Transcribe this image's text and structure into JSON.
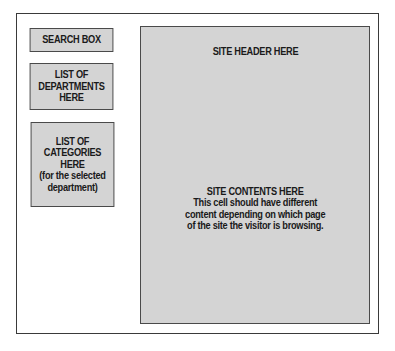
{
  "diagram": {
    "type": "page-layout-wireframe",
    "colors": {
      "background": "#ffffff",
      "frame_border": "#3a3a3a",
      "box_fill": "#d4d4d4",
      "box_border": "#4a4a4a",
      "text": "#1a1a1a"
    },
    "sidebar": {
      "search_box": {
        "label": "SEARCH BOX"
      },
      "departments_box": {
        "label": "LIST OF\nDEPARTMENTS\nHERE"
      },
      "categories_box": {
        "label": "LIST OF\nCATEGORIES\nHERE\n(for the selected\ndepartment)"
      }
    },
    "main": {
      "header": {
        "label": "SITE HEADER HERE"
      },
      "contents": {
        "title": "SITE CONTENTS HERE",
        "description": "This cell should have different\ncontent depending on which page\nof the site the visitor is browsing."
      }
    }
  }
}
